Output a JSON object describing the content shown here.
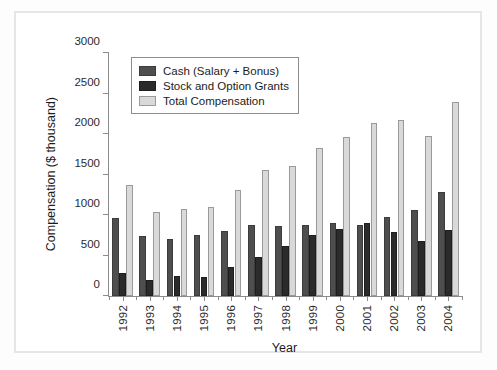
{
  "chart_data": {
    "type": "bar",
    "title": "",
    "xlabel": "Year",
    "ylabel": "Compensation ($ thousand)",
    "ylim": [
      0,
      3000
    ],
    "yticks": [
      0,
      500,
      1000,
      1500,
      2000,
      2500,
      3000
    ],
    "ytick_labels": [
      "0",
      "500",
      "1000",
      "1500",
      "2000",
      "2500",
      "3000"
    ],
    "grid": false,
    "legend_position": "upper left",
    "categories": [
      "1992",
      "1993",
      "1994",
      "1995",
      "1996",
      "1997",
      "1998",
      "1999",
      "2000",
      "2001",
      "2002",
      "2003",
      "2004"
    ],
    "series": [
      {
        "name": "Cash (Salary + Bonus)",
        "color": "#4e4e4e",
        "values": [
          960,
          740,
          710,
          750,
          800,
          880,
          860,
          880,
          900,
          880,
          970,
          1060,
          1280
        ]
      },
      {
        "name": "Stock and Option Grants",
        "color": "#2b2b2b",
        "values": [
          290,
          195,
          245,
          240,
          360,
          480,
          620,
          750,
          830,
          900,
          790,
          680,
          810
        ]
      },
      {
        "name": "Total Compensation",
        "color": "#d9d9d9",
        "values": [
          1375,
          1040,
          1080,
          1100,
          1310,
          1560,
          1610,
          1830,
          1960,
          2130,
          2170,
          1980,
          2400
        ]
      }
    ]
  },
  "legend": {
    "items": [
      {
        "label": "Cash (Salary + Bonus)",
        "key": "cash"
      },
      {
        "label": "Stock and Option Grants",
        "key": "stock"
      },
      {
        "label": "Total Compensation",
        "key": "total"
      }
    ]
  },
  "colors": {
    "cash": "#4e4e4e",
    "stock": "#2b2b2b",
    "total": "#d9d9d9",
    "axis": "#8c8c8c",
    "frame": "#e6e6e6",
    "background": "#ffffff"
  }
}
